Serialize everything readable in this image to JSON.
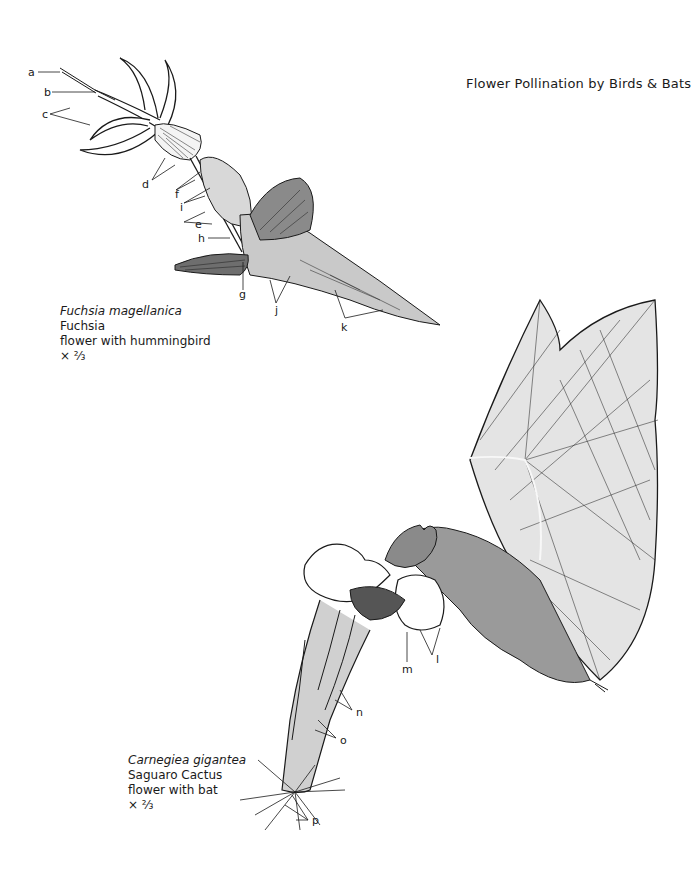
{
  "page": {
    "title": "Flower Pollination by Birds & Bats"
  },
  "figures": [
    {
      "id": "fuchsia",
      "scientific_name": "Fuchsia magellanica",
      "common_name": "Fuchsia",
      "description": "flower with hummingbird",
      "scale": "× ⅔",
      "labels": [
        "a",
        "b",
        "c",
        "d",
        "e",
        "f",
        "g",
        "h",
        "i",
        "j",
        "k"
      ]
    },
    {
      "id": "saguaro",
      "scientific_name": "Carnegiea gigantea",
      "common_name": "Saguaro Cactus",
      "description": "flower with bat",
      "scale": "× ⅔",
      "labels": [
        "l",
        "m",
        "n",
        "o",
        "p"
      ]
    }
  ],
  "colors": {
    "ink": "#1a1a1a",
    "paper": "#ffffff"
  }
}
